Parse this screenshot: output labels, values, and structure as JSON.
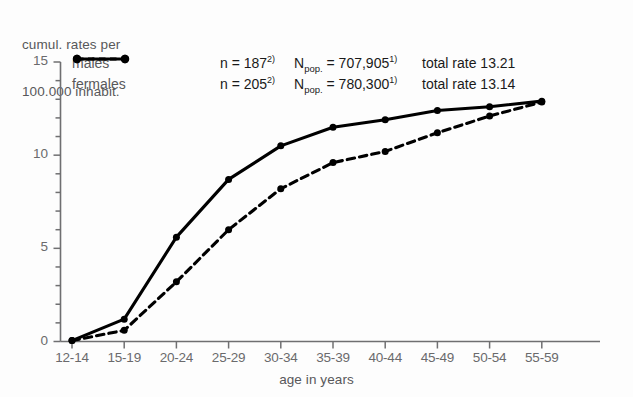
{
  "chart_data": {
    "type": "line",
    "title": "",
    "ylabel": "cumul. rates per\n100.000 inhabit.",
    "ylabel_line1": "cumul. rates per",
    "ylabel_line2": "100.000 inhabit.",
    "xlabel": "age in years",
    "categories": [
      "12-14",
      "15-19",
      "20-24",
      "25-29",
      "30-34",
      "35-39",
      "40-44",
      "45-49",
      "50-54",
      "55-59"
    ],
    "ylim": [
      0,
      15
    ],
    "xlim": [
      0,
      9
    ],
    "y_ticks": [
      "0",
      "5",
      "10",
      "15"
    ],
    "y_tick_values": [
      0,
      5,
      10,
      15
    ],
    "y_minor_step": 1,
    "grid": false,
    "legend_position": "top-left-inside",
    "series": [
      {
        "name": "males",
        "style": "solid",
        "color": "#000000",
        "values": [
          0.05,
          1.2,
          5.6,
          8.7,
          10.5,
          11.5,
          11.9,
          12.4,
          12.6,
          12.9
        ]
      },
      {
        "name": "fermales",
        "style": "dashed",
        "color": "#000000",
        "values": [
          0.05,
          0.6,
          3.2,
          6.0,
          8.2,
          9.6,
          10.2,
          11.2,
          12.1,
          12.85
        ]
      }
    ]
  },
  "legend": {
    "rows": [
      {
        "name": "males",
        "marker": "solid-line-marker",
        "n_label": "n = ",
        "n_value": "187",
        "n_sup": "2)",
        "npop_label": "N",
        "npop_sub": "pop.",
        "npop_eq": " = ",
        "npop_value": "707,905",
        "npop_sup": "1)",
        "total_label": "total rate 13.21"
      },
      {
        "name": "fermales",
        "marker": "dashed-line-marker",
        "n_label": "n = ",
        "n_value": "205",
        "n_sup": "2)",
        "npop_label": "N",
        "npop_sub": "pop.",
        "npop_eq": " = ",
        "npop_value": "780,300",
        "npop_sup": "1)",
        "total_label": "total rate 13.14"
      }
    ]
  },
  "colors": {
    "line": "#000000",
    "axis": "#6f6f71",
    "text": "#58585a"
  }
}
